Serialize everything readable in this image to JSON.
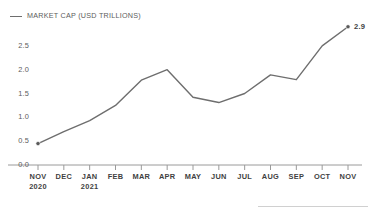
{
  "legend": {
    "marker": "line-swatch",
    "label": "MARKET CAP (USD TRILLIONS)"
  },
  "annotations": {
    "end_value": "2.9"
  },
  "footer": {
    "rule": "divider-rule"
  },
  "chart_data": {
    "type": "line",
    "title": "",
    "subtitle": "",
    "xlabel": "",
    "ylabel": "",
    "legend": [
      "MARKET CAP (USD TRILLIONS)"
    ],
    "legend_position": "top-left",
    "grid": false,
    "ylim": [
      0.0,
      3.0
    ],
    "yticks": [
      0.0,
      0.5,
      1.0,
      1.5,
      2.0,
      2.5
    ],
    "ytick_labels": [
      "0.0",
      "0.5",
      "1.0",
      "1.5",
      "2.0",
      "2.5"
    ],
    "categories": [
      "NOV",
      "DEC",
      "JAN",
      "FEB",
      "MAR",
      "APR",
      "MAY",
      "JUN",
      "JUL",
      "AUG",
      "SEP",
      "OCT",
      "NOV"
    ],
    "category_sublabels": [
      "2020",
      "",
      "2021",
      "",
      "",
      "",
      "",
      "",
      "",
      "",
      "",
      "",
      ""
    ],
    "series": [
      {
        "name": "MARKET CAP (USD TRILLIONS)",
        "color": "#6e6e6e",
        "values": [
          0.45,
          0.7,
          0.93,
          1.25,
          1.78,
          2.0,
          1.42,
          1.31,
          1.5,
          1.89,
          1.79,
          2.5,
          2.9
        ]
      }
    ],
    "markers": [
      {
        "category": "NOV",
        "index": 0,
        "value": 0.45
      },
      {
        "category": "NOV",
        "index": 12,
        "value": 2.9,
        "label": "2.9"
      }
    ]
  }
}
